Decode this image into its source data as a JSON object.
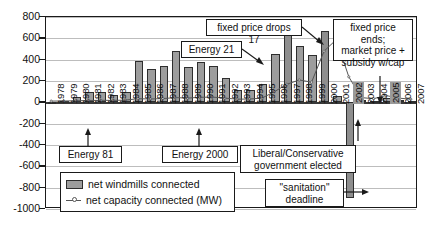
{
  "chart_data": {
    "type": "bar",
    "title": "",
    "xlabel": "",
    "ylabel": "",
    "ylim": [
      -1000,
      800
    ],
    "grid": true,
    "legend_position": "inside-bottom-left",
    "categories": [
      "1978",
      "1979",
      "1980",
      "1981",
      "1982",
      "1983",
      "1984",
      "1985",
      "1986",
      "1987",
      "1988",
      "1989",
      "1990",
      "1991",
      "1992",
      "1993",
      "1994",
      "1995",
      "1996",
      "1997",
      "1998",
      "1999",
      "2000",
      "2001",
      "2002",
      "2003",
      "2004",
      "2005",
      "2006",
      "2007"
    ],
    "ytick_labels": [
      "800",
      "600",
      "400",
      "200",
      "0",
      "-200",
      "-400",
      "-600",
      "-800",
      "-1000"
    ],
    "ytick_values": [
      800,
      600,
      400,
      200,
      0,
      -200,
      -400,
      -600,
      -800,
      -1000
    ],
    "series": [
      {
        "name": "net windmills connected",
        "type": "bar",
        "color": "#9d9d9d",
        "values": [
          5,
          8,
          50,
          95,
          95,
          72,
          100,
          390,
          310,
          340,
          480,
          330,
          380,
          345,
          230,
          115,
          120,
          170,
          450,
          640,
          530,
          440,
          670,
          60,
          -900,
          20,
          15,
          40,
          18,
          12
        ]
      },
      {
        "name": "net capacity connected (MW)",
        "type": "line",
        "color": "#555555",
        "values": [
          2,
          3,
          5,
          8,
          10,
          9,
          12,
          25,
          22,
          26,
          35,
          30,
          38,
          40,
          30,
          20,
          22,
          30,
          90,
          160,
          200,
          180,
          470,
          580,
          230,
          35,
          25,
          55,
          30,
          20
        ]
      }
    ],
    "highlighted_year_labels": [
      "2002",
      "2005"
    ],
    "annotations": [
      {
        "id": "energy-81",
        "text": "Energy 81",
        "target_year": "1981",
        "lines": [
          "Energy 81"
        ]
      },
      {
        "id": "energy-2000",
        "text": "Energy 2000",
        "target_year": "1990",
        "lines": [
          "Energy 2000"
        ]
      },
      {
        "id": "energy-21",
        "text": "Energy 21",
        "target_year": "1996",
        "lines": [
          "Energy 21"
        ]
      },
      {
        "id": "fixed-price-drops-17",
        "text": "fixed price drops 17",
        "target_year": "1999",
        "lines": [
          "fixed price drops 17"
        ]
      },
      {
        "id": "fixed-price-ends",
        "text": "fixed price ends; market price + subsidy w/cap",
        "target_year": "2003",
        "lines": [
          "fixed price ends;",
          "market price +",
          "subsidy w/cap"
        ]
      },
      {
        "id": "liberal-conservative",
        "text": "Liberal/Conservative government elected",
        "target_year": "2001",
        "lines": [
          "Liberal/Conservative",
          "government elected"
        ]
      },
      {
        "id": "sanitation-deadline",
        "text": "\"sanitation\" deadline",
        "target_year": "2002",
        "lines": [
          "\"sanitation\"",
          "deadline"
        ]
      }
    ],
    "legend_entries": [
      {
        "label": "net windmills connected",
        "marker": "bar-swatch"
      },
      {
        "label": "net capacity connected (MW)",
        "marker": "line-marker"
      }
    ]
  },
  "colors": {
    "bar_fill": "#9d9d9d",
    "bar_stroke": "#2e2e2e",
    "line": "#555555",
    "axis": "#1a1a1a",
    "grid": "#bdbdbd",
    "background": "#ffffff",
    "text": "#111111"
  }
}
